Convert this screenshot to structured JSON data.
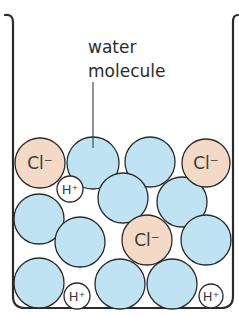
{
  "diagram": {
    "label": {
      "line1": "water",
      "line2": "molecule"
    },
    "colors": {
      "water_fill": "#bfe3f3",
      "chloride_fill": "#f4d9c6",
      "hydrogen_fill": "#ffffff",
      "stroke": "#2b2b2b",
      "background": "#ffffff"
    },
    "ions": {
      "chloride": "Cl⁻",
      "hydrogen": "H⁺"
    },
    "particles": [
      {
        "type": "water",
        "cx": 93,
        "cy": 163,
        "r": 26,
        "labeled": true
      },
      {
        "type": "water",
        "cx": 150,
        "cy": 162,
        "r": 25
      },
      {
        "type": "water",
        "cx": 123,
        "cy": 198,
        "r": 25
      },
      {
        "type": "water",
        "cx": 182,
        "cy": 202,
        "r": 25
      },
      {
        "type": "water",
        "cx": 39,
        "cy": 219,
        "r": 25
      },
      {
        "type": "water",
        "cx": 80,
        "cy": 242,
        "r": 25
      },
      {
        "type": "water",
        "cx": 206,
        "cy": 240,
        "r": 25
      },
      {
        "type": "water",
        "cx": 39,
        "cy": 283,
        "r": 25
      },
      {
        "type": "water",
        "cx": 120,
        "cy": 284,
        "r": 25
      },
      {
        "type": "water",
        "cx": 172,
        "cy": 284,
        "r": 25
      },
      {
        "type": "chloride",
        "cx": 40,
        "cy": 163,
        "r": 25
      },
      {
        "type": "chloride",
        "cx": 206,
        "cy": 163,
        "r": 24
      },
      {
        "type": "chloride",
        "cx": 147,
        "cy": 240,
        "r": 25
      },
      {
        "type": "hydrogen",
        "cx": 70,
        "cy": 189,
        "r": 13
      },
      {
        "type": "hydrogen",
        "cx": 77,
        "cy": 296,
        "r": 13
      },
      {
        "type": "hydrogen",
        "cx": 211,
        "cy": 296,
        "r": 12
      }
    ]
  }
}
